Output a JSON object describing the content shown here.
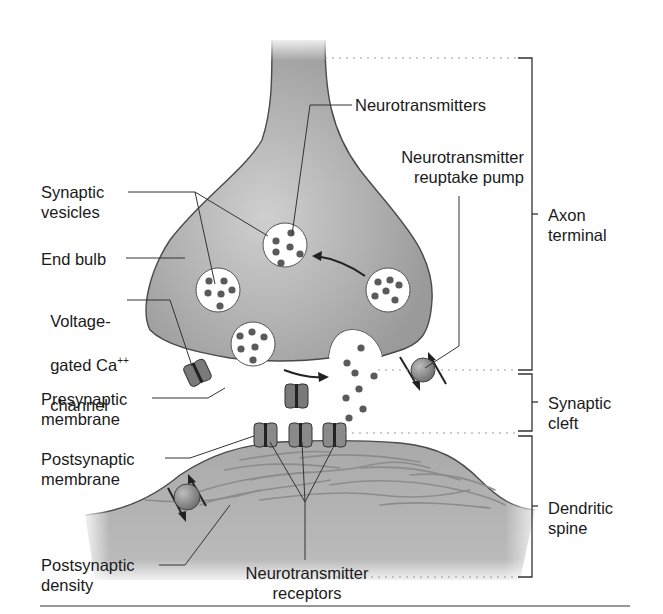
{
  "diagram": {
    "colors": {
      "tissue": "#a8a8a8",
      "tissue_light": "#c9c9c9",
      "vesicle": "#ffffff",
      "neurotransmitter": "#5a5a5a",
      "channel": "#7a7a7a",
      "pump": "#8e8e8e",
      "line": "#333333",
      "text": "#1a1a1a"
    },
    "left_labels": {
      "synaptic_vesicles": "Synaptic\nvesicles",
      "end_bulb": "End bulb",
      "voltage_channel_line1": "Voltage-",
      "voltage_channel_line2": "gated Ca",
      "voltage_channel_sup": "++",
      "voltage_channel_line3": "channel",
      "presynaptic_membrane": "Presynaptic\nmembrane",
      "postsynaptic_membrane": "Postsynaptic\nmembrane",
      "postsynaptic_density": "Postsynaptic\ndensity"
    },
    "center_labels": {
      "neurotransmitters": "Neurotransmitters",
      "reuptake_pump": "Neurotransmitter\nreuptake pump",
      "receptors": "Neurotransmitter\nreceptors"
    },
    "brackets": [
      {
        "label": "Axon\nterminal",
        "y_top": 58,
        "y_bottom": 370
      },
      {
        "label": "Synaptic\ncleft",
        "y_top": 373,
        "y_bottom": 432
      },
      {
        "label": "Dendritic\nspine",
        "y_top": 436,
        "y_bottom": 577
      }
    ]
  }
}
